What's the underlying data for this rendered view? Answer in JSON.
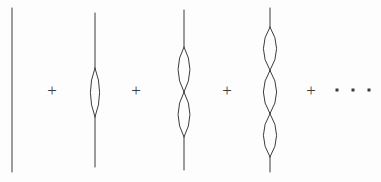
{
  "figure": {
    "kind": "feynman-bubble-chain-series",
    "background_color": "#fdfdfd",
    "stroke_color": "#3c3c3c",
    "stroke_width": 1,
    "width": 381,
    "height": 182
  },
  "terms": [
    {
      "id": "term-0",
      "name": "bare-propagator",
      "label": "",
      "bubbles": 0,
      "line_x": 12,
      "line_top": 8,
      "line_bottom": 172,
      "bubble_half_width": 0,
      "bubble_span_top": 0,
      "bubble_span_bottom": 0
    },
    {
      "id": "term-1",
      "name": "one-bubble-propagator",
      "label": "",
      "bubbles": 1,
      "line_x": 95,
      "line_top": 13,
      "line_bottom": 167,
      "bubble_half_width": 7,
      "bubble_span_top": 68,
      "bubble_span_bottom": 117
    },
    {
      "id": "term-2",
      "name": "two-bubble-propagator",
      "label": "",
      "bubbles": 2,
      "line_x": 184,
      "line_top": 10,
      "line_bottom": 170,
      "bubble_half_width": 9,
      "bubble_span_top": 47,
      "bubble_span_bottom": 137
    },
    {
      "id": "term-3",
      "name": "three-bubble-propagator",
      "label": "",
      "bubbles": 3,
      "line_x": 270,
      "line_top": 8,
      "line_bottom": 172,
      "bubble_half_width": 10,
      "bubble_span_top": 27,
      "bubble_span_bottom": 157
    }
  ],
  "operators": [
    {
      "id": "plus-1",
      "symbol": "+",
      "x": 52,
      "y": 90
    },
    {
      "id": "plus-2",
      "symbol": "+",
      "x": 136,
      "y": 90
    },
    {
      "id": "plus-3",
      "symbol": "+",
      "x": 227,
      "y": 90
    },
    {
      "id": "plus-4",
      "symbol": "+",
      "x": 311,
      "y": 90
    }
  ],
  "ellipsis": {
    "id": "ellipsis",
    "symbol": "· · ·",
    "dots": [
      {
        "x": 337,
        "y": 90
      },
      {
        "x": 353,
        "y": 90
      },
      {
        "x": 369,
        "y": 90
      }
    ]
  }
}
